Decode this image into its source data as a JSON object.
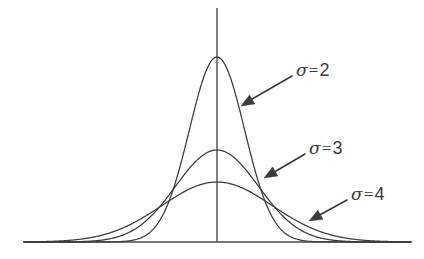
{
  "figure": {
    "kind": "gaussian-density-curves",
    "background_color": "#ffffff",
    "stroke_color": "#3b3b3b",
    "axis_color": "#4a4a4a",
    "text_color": "#3a3a3a"
  },
  "annotations": [
    {
      "id": "sigma-2",
      "symbol": "σ",
      "equals": "=",
      "value": "2",
      "label_x": 296,
      "label_y": 61,
      "leader": {
        "x1": 292,
        "y1": 76,
        "x2": 247,
        "y2": 102
      },
      "arrow_tip": {
        "x": 241,
        "y": 106
      },
      "arrow_angle_deg": 210
    },
    {
      "id": "sigma-3",
      "symbol": "σ",
      "equals": "=",
      "value": "3",
      "label_x": 309,
      "label_y": 139,
      "leader": {
        "x1": 305,
        "y1": 154,
        "x2": 271,
        "y2": 174
      },
      "arrow_tip": {
        "x": 264,
        "y": 178
      },
      "arrow_angle_deg": 210
    },
    {
      "id": "sigma-4",
      "symbol": "σ",
      "equals": "=",
      "value": "4",
      "label_x": 351,
      "label_y": 185,
      "leader": {
        "x1": 347,
        "y1": 200,
        "x2": 316,
        "y2": 217
      },
      "arrow_tip": {
        "x": 309,
        "y": 221
      },
      "arrow_angle_deg": 210
    }
  ],
  "chart_data": {
    "type": "line",
    "title": "",
    "xlabel": "",
    "ylabel": "",
    "grid": false,
    "legend_position": "inline-annotations",
    "center_x": 0,
    "axis": {
      "baseline_y_px": 242,
      "baseline_x_start_px": 26,
      "baseline_x_end_px": 412,
      "vertical_axis_x_px": 217,
      "vertical_axis_top_px": 8
    },
    "x_domain": [
      -14,
      14
    ],
    "x_pixels_per_unit": 13.8,
    "series": [
      {
        "name": "σ = 2",
        "sigma": 2,
        "mu": 0,
        "peak_height_px": 185,
        "peak_y_px": 57,
        "color": "#3b3b3b",
        "x": [
          -14,
          -12,
          -10,
          -8,
          -6,
          -5,
          -4,
          -3,
          -2,
          -1,
          0,
          1,
          2,
          3,
          4,
          5,
          6,
          8,
          10,
          12,
          14
        ],
        "y": [
          0.0,
          0.0,
          0.0,
          0.9,
          6.1,
          12.9,
          25.0,
          58.3,
          112.3,
          163.9,
          185.0,
          163.9,
          112.3,
          58.3,
          25.0,
          12.9,
          6.1,
          0.9,
          0.0,
          0.0,
          0.0
        ]
      },
      {
        "name": "σ = 3",
        "sigma": 3,
        "mu": 0,
        "peak_height_px": 92,
        "peak_y_px": 150,
        "color": "#3b3b3b",
        "x": [
          -14,
          -12,
          -10,
          -8,
          -6,
          -5,
          -4,
          -3,
          -2,
          -1,
          0,
          1,
          2,
          3,
          4,
          5,
          6,
          8,
          10,
          12,
          14
        ],
        "y": [
          0.3,
          1.3,
          3.9,
          11.1,
          24.9,
          35.1,
          45.9,
          55.8,
          71.4,
          87.1,
          92.0,
          87.1,
          71.4,
          55.8,
          45.9,
          35.1,
          24.9,
          11.1,
          3.9,
          1.3,
          0.3
        ]
      },
      {
        "name": "σ = 4",
        "sigma": 4,
        "mu": 0,
        "peak_height_px": 60,
        "peak_y_px": 182,
        "color": "#3b3b3b",
        "x": [
          -14,
          -12,
          -10,
          -8,
          -6,
          -5,
          -4,
          -3,
          -2,
          -1,
          0,
          1,
          2,
          3,
          4,
          5,
          6,
          8,
          10,
          12,
          14
        ],
        "y": [
          1.4,
          3.3,
          7.0,
          13.5,
          24.0,
          29.7,
          36.4,
          42.7,
          49.9,
          56.2,
          60.0,
          56.2,
          49.9,
          42.7,
          36.4,
          29.7,
          24.0,
          13.5,
          7.0,
          3.3,
          1.4
        ]
      }
    ]
  }
}
